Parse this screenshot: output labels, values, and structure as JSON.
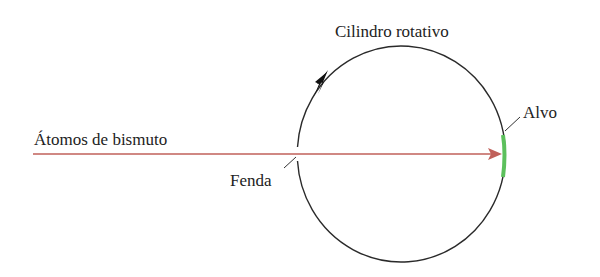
{
  "diagram": {
    "labels": {
      "beam": "Átomos de bismuto",
      "slit": "Fenda",
      "cylinder": "Cilindro rotativo",
      "target": "Alvo"
    },
    "colors": {
      "beam": "#c0605a",
      "cylinder": "#222222",
      "target": "#5cc05c",
      "text": "#222222"
    },
    "elements": [
      {
        "id": "beam-arrow",
        "type": "arrow",
        "direction": "right"
      },
      {
        "id": "rotating-cylinder",
        "type": "circle",
        "rotation": "clockwise"
      },
      {
        "id": "slit",
        "type": "gap",
        "position": "left side of cylinder"
      },
      {
        "id": "target",
        "type": "arc-strip",
        "position": "right inner side of cylinder"
      }
    ]
  }
}
